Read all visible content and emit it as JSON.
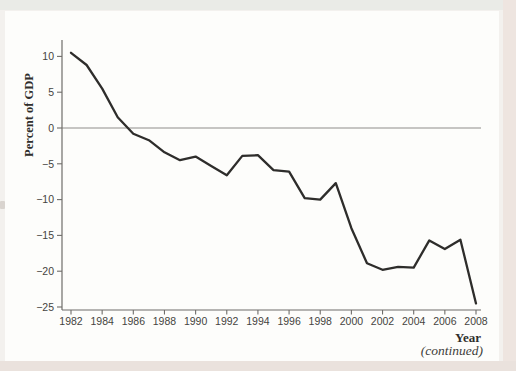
{
  "page": {
    "continued_label": "(continued)"
  },
  "chart_data": {
    "type": "line",
    "title": "",
    "ylabel": "Percent of GDP",
    "xlabel": "Year",
    "x": [
      1982,
      1983,
      1984,
      1985,
      1986,
      1987,
      1988,
      1989,
      1990,
      1991,
      1992,
      1993,
      1994,
      1995,
      1996,
      1997,
      1998,
      1999,
      2000,
      2001,
      2002,
      2003,
      2004,
      2005,
      2006,
      2007,
      2008
    ],
    "values": [
      10.5,
      8.8,
      5.5,
      1.5,
      -0.8,
      -1.7,
      -3.4,
      -4.5,
      -4.0,
      -5.3,
      -6.6,
      -3.9,
      -3.8,
      -5.9,
      -6.1,
      -9.8,
      -10.0,
      -7.7,
      -14.0,
      -18.9,
      -19.8,
      -19.4,
      -19.5,
      -15.7,
      -16.9,
      -15.6,
      -24.5
    ],
    "x_ticks": [
      1982,
      1984,
      1986,
      1988,
      1990,
      1992,
      1994,
      1996,
      1998,
      2000,
      2002,
      2004,
      2006,
      2008
    ],
    "y_ticks": [
      10,
      5,
      0,
      -5,
      -10,
      -15,
      -20,
      -25
    ],
    "ylim": [
      -25,
      12
    ],
    "xlim": [
      1982,
      2008
    ],
    "zero_line": true,
    "grid": false,
    "legend": "none",
    "colors": {
      "line": "#2e2d2b",
      "axis": "#6f6d6a",
      "zero_line": "#8f8d8a",
      "tick_text": "#454440",
      "axis_title_text": "#2f2e2b",
      "card_bg": "#fdfdfb",
      "page_bg": "#f3f1ee"
    }
  }
}
